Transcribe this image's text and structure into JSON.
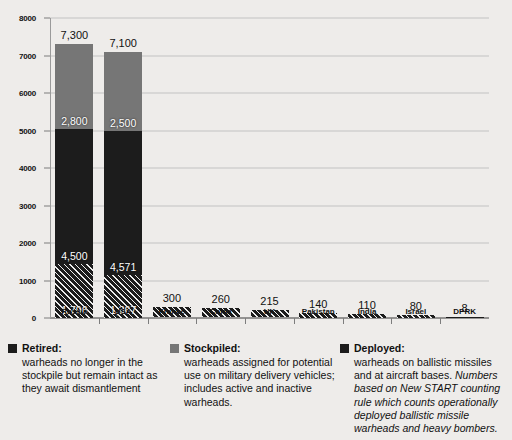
{
  "chart_data": {
    "type": "bar",
    "stacked": true,
    "title": "",
    "xlabel": "",
    "ylabel": "",
    "ylim": [
      0,
      8000
    ],
    "ytick_step": 1000,
    "yticks": [
      "0",
      "1000",
      "2000",
      "3000",
      "4000",
      "5000",
      "6000",
      "7000",
      "8000"
    ],
    "grid": true,
    "legend_position": "bottom",
    "categories": [
      "Russia",
      "USA",
      "France",
      "China",
      "UK",
      "Pakistan",
      "India",
      "Israel",
      "DPRK"
    ],
    "series": [
      {
        "name": "Deployed",
        "key": "deployed",
        "color": "#1c1c1c",
        "pattern": "diagonal-hatch",
        "values": [
          1796,
          1367,
          280,
          240,
          195,
          130,
          100,
          70,
          8
        ]
      },
      {
        "name": "Retired",
        "key": "retired",
        "color": "#1c1c1c",
        "pattern": "solid",
        "values": [
          4500,
          4571,
          0,
          0,
          0,
          0,
          0,
          0,
          0
        ]
      },
      {
        "name": "Stockpiled",
        "key": "stockpiled",
        "color": "#767676",
        "pattern": "solid",
        "values": [
          2800,
          2500,
          0,
          0,
          0,
          0,
          0,
          0,
          0
        ]
      }
    ],
    "totals": [
      7300,
      7100,
      300,
      260,
      215,
      140,
      110,
      80,
      8
    ],
    "total_labels": [
      "7,300",
      "7,100",
      "300",
      "260",
      "215",
      "140",
      "110",
      "80",
      "8"
    ],
    "segment_labels": {
      "stockpiled": [
        "2,800",
        "2,500",
        "",
        "",
        "",
        "",
        "",
        "",
        ""
      ],
      "retired": [
        "4,500",
        "4,571",
        "",
        "",
        "",
        "",
        "",
        "",
        ""
      ],
      "deployed": [
        "1,796",
        "1,367",
        "",
        "",
        "",
        "",
        "",
        "",
        ""
      ]
    }
  },
  "legend": [
    {
      "id": "retired",
      "title": "Retired:",
      "swatch_color": "#1c1c1c",
      "description": "warheads no longer in the stockpile but remain intact as they await dismantlement",
      "description_italic": ""
    },
    {
      "id": "stockpiled",
      "title": "Stockpiled:",
      "swatch_color": "#767676",
      "description": "warheads assigned for potential use on military delivery vehicles; includes active and inactive warheads.",
      "description_italic": ""
    },
    {
      "id": "deployed",
      "title": "Deployed:",
      "swatch_color": "#1c1c1c",
      "description": "warheads on ballistic missiles and at aircraft bases. ",
      "description_italic": "Numbers based on New START counting rule which counts operationally deployed ballistic missile warheads and heavy bombers."
    }
  ],
  "colors": {
    "background": "#eeecea",
    "grid": "#c2c2c2",
    "axis": "#7d7d7d",
    "stockpiled": "#767676",
    "retired": "#1c1c1c",
    "deployed": "#1c1c1c",
    "text": "#111111"
  }
}
